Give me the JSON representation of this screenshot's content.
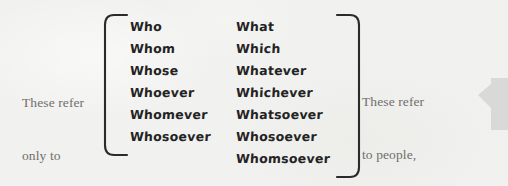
{
  "figure": {
    "background_color": "#f1f1ef",
    "ink_color": "#232323",
    "caption_color": "#706f6c",
    "accent_color": "#d9d9d9"
  },
  "captions": {
    "left": {
      "name": "people-only-caption",
      "lines": [
        "These refer",
        "only to",
        "people"
      ]
    },
    "right": {
      "name": "people-places-things-caption",
      "lines": [
        "These refer",
        "to people,",
        "places, or",
        "things"
      ]
    }
  },
  "columns": [
    {
      "id": "people",
      "words": [
        "Who",
        "Whom",
        "Whose",
        "Whoever",
        "Whomever",
        "Whosoever"
      ]
    },
    {
      "id": "things",
      "words": [
        "What",
        "Which",
        "Whatever",
        "Whichever",
        "Whatsoever",
        "Whosoever",
        "Whomsoever"
      ]
    }
  ],
  "decorations": {
    "bracket_left": "left-curly-bracket",
    "bracket_right": "right-curly-bracket",
    "edge_tab": "left-pointing-tab-arrow"
  }
}
